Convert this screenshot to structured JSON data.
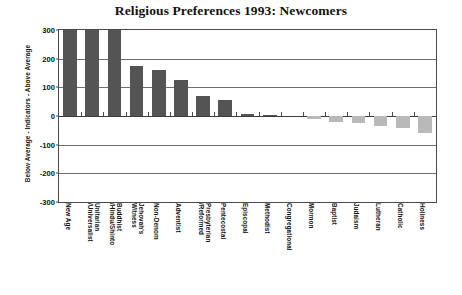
{
  "chart_data": {
    "type": "bar",
    "title": "Religious Preferences 1993: Newcomers",
    "xlabel": "",
    "ylabel": "Below Average - Indicators - Above Average",
    "ylim": [
      -300,
      300
    ],
    "yticks": [
      300,
      200,
      100,
      0,
      -100,
      -200,
      -300
    ],
    "ytick_labels": [
      "300",
      "200",
      "100",
      "0",
      "-100",
      "-200",
      "-300"
    ],
    "grid": true,
    "legend": false,
    "colors": {
      "positive_bar": "#545454",
      "negative_bar": "#b9b9b9",
      "axis": "#4a4a4a",
      "text": "#111111"
    },
    "categories": [
      "New Age",
      "Unitarian\n/Universalist",
      "Buddhist\n/Hindu/Shinto",
      "Jehovah's\nWitness",
      "Non-Denom",
      "Adventist",
      "Presbyterian\n/Reformed",
      "Pentecostal",
      "Episcopal",
      "Methodist",
      "Congregational",
      "Mormon",
      "Baptist",
      "Judaism",
      "Lutheran",
      "Catholic",
      "Holiness"
    ],
    "values": [
      300,
      300,
      300,
      175,
      160,
      125,
      70,
      55,
      8,
      3,
      0,
      -12,
      -20,
      -26,
      -34,
      -42,
      -58
    ]
  }
}
